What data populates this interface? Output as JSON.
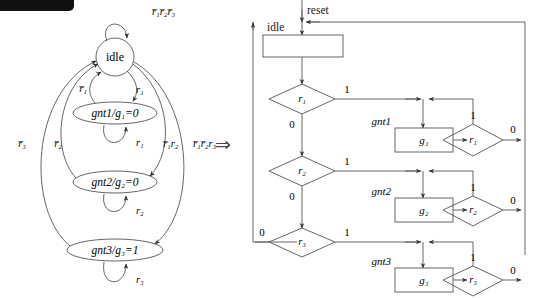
{
  "figure": {
    "implication_arrow": "⇒",
    "black_bar": "redaction-bar"
  },
  "state_diagram": {
    "title": "arbiter-fsm-state-diagram",
    "states": [
      {
        "id": "idle",
        "label": "idle",
        "shape": "circle"
      },
      {
        "id": "gnt1",
        "label": "gnt1/g₁=0",
        "shape": "ellipse"
      },
      {
        "id": "gnt2",
        "label": "gnt2/g₂=0",
        "shape": "ellipse"
      },
      {
        "id": "gnt3",
        "label": "gnt3/g₃=1",
        "shape": "ellipse"
      }
    ],
    "self_loops": [
      {
        "state": "idle",
        "label": "r̅₁r̅₂r̅₃"
      },
      {
        "state": "gnt1",
        "label": "r₁"
      },
      {
        "state": "gnt2",
        "label": "r₂"
      },
      {
        "state": "gnt3",
        "label": "r₃"
      }
    ],
    "transitions": [
      {
        "from": "idle",
        "to": "gnt1",
        "label": "r₁"
      },
      {
        "from": "gnt1",
        "to": "idle",
        "label": "r̅₁"
      },
      {
        "from": "idle",
        "to": "gnt2",
        "label": "r̅₁r₂"
      },
      {
        "from": "gnt2",
        "to": "idle",
        "label": "r̅₂"
      },
      {
        "from": "idle",
        "to": "gnt3",
        "label": "r̅₁r̅₂r₃"
      },
      {
        "from": "gnt3",
        "to": "idle",
        "label": "r̅₃"
      }
    ]
  },
  "flowchart": {
    "title": "arbiter-ashenden-chart",
    "reset_label": "reset",
    "idle_label": "idle",
    "branches": [
      {
        "condition": "r₁",
        "false_label": "0",
        "true_label": "1",
        "action_label": "gnt1",
        "action_box": "g₁",
        "wait_condition": "r₁",
        "wait_true_label": "1",
        "wait_false_label": "0"
      },
      {
        "condition": "r₂",
        "false_label": "0",
        "true_label": "1",
        "action_label": "gnt2",
        "action_box": "g₂",
        "wait_condition": "r₂",
        "wait_true_label": "1",
        "wait_false_label": "0"
      },
      {
        "condition": "r₃",
        "false_label": "0",
        "true_label": "1",
        "action_label": "gnt3",
        "action_box": "g₃",
        "wait_condition": "r₃",
        "wait_true_label": "1",
        "wait_false_label": "0"
      }
    ]
  },
  "colors": {
    "ink": "#1a1a1a",
    "line": "#555555",
    "background": "#ffffff"
  }
}
